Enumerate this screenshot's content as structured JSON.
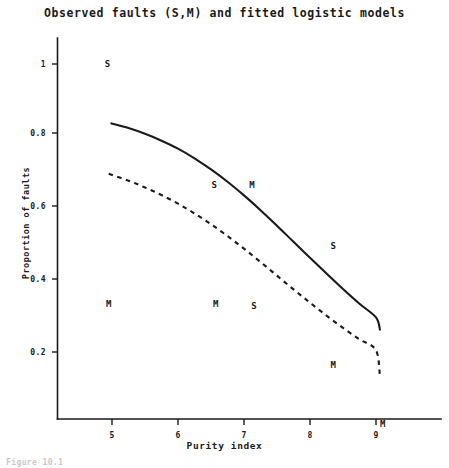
{
  "chart_data": {
    "type": "line",
    "title": "Observed faults (S,M) and fitted logistic models",
    "xlabel": "Purity index",
    "ylabel": "Proportion of faults",
    "xlim": [
      4.55,
      9.9
    ],
    "ylim": [
      0,
      1.06
    ],
    "xticks": [
      5,
      6,
      7,
      8,
      9
    ],
    "xtick_labels": [
      "5",
      "6",
      "7",
      "8",
      "9"
    ],
    "yticks": [
      0.2,
      0.4,
      0.6,
      0.8,
      1
    ],
    "ytick_labels": [
      "0.2",
      "0.4",
      "0.6",
      "0.8",
      "1"
    ],
    "grid": false,
    "legend": "none",
    "series": [
      {
        "name": "fitted logistic model S",
        "style": "solid",
        "x": [
          4.99,
          5.25,
          5.5,
          5.75,
          6.0,
          6.25,
          6.5,
          6.75,
          7.0,
          7.25,
          7.5,
          7.75,
          8.0,
          8.25,
          8.5,
          8.75,
          9.0,
          9.06
        ],
        "y": [
          0.835,
          0.822,
          0.806,
          0.787,
          0.765,
          0.738,
          0.707,
          0.673,
          0.635,
          0.594,
          0.551,
          0.506,
          0.462,
          0.418,
          0.375,
          0.334,
          0.296,
          0.262
        ]
      },
      {
        "name": "fitted logistic model M",
        "style": "dashed",
        "x": [
          4.95,
          5.25,
          5.5,
          5.75,
          6.0,
          6.25,
          6.5,
          6.75,
          7.0,
          7.25,
          7.5,
          7.75,
          8.0,
          8.25,
          8.5,
          8.75,
          9.0,
          9.06
        ],
        "y": [
          0.695,
          0.676,
          0.657,
          0.636,
          0.612,
          0.585,
          0.555,
          0.522,
          0.487,
          0.45,
          0.412,
          0.374,
          0.337,
          0.301,
          0.267,
          0.235,
          0.205,
          0.131
        ]
      }
    ],
    "observed_points": [
      {
        "label": "S",
        "x": 4.93,
        "y": 1.0
      },
      {
        "label": "M",
        "x": 4.95,
        "y": 0.335
      },
      {
        "label": "S",
        "x": 6.55,
        "y": 0.665
      },
      {
        "label": "M",
        "x": 7.12,
        "y": 0.665
      },
      {
        "label": "M",
        "x": 6.57,
        "y": 0.335
      },
      {
        "label": "S",
        "x": 7.15,
        "y": 0.329
      },
      {
        "label": "S",
        "x": 8.35,
        "y": 0.495
      },
      {
        "label": "M",
        "x": 8.35,
        "y": 0.165
      },
      {
        "label": "M",
        "x": 9.1,
        "y": 0.0
      }
    ],
    "colors": {
      "foreground": "#1a1a1a",
      "background": "#ffffff"
    }
  },
  "caption": {
    "text": "Figure 10.1"
  }
}
